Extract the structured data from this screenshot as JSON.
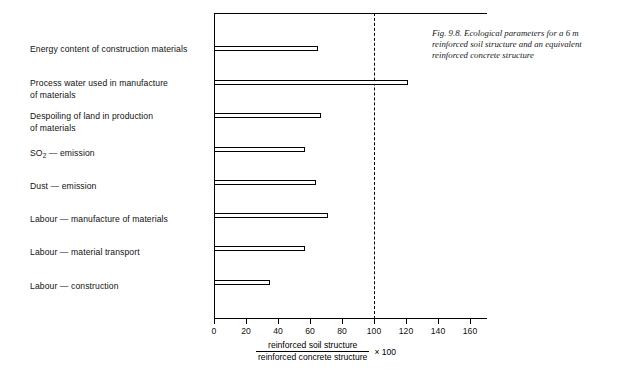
{
  "figure": {
    "caption": "Fig. 9.8. Ecological parameters for a 6 m reinforced soil structure and an equivalent reinforced concrete structure"
  },
  "axis": {
    "tick_labels": [
      "0",
      "20",
      "40",
      "60",
      "80",
      "100",
      "120",
      "140",
      "160"
    ],
    "caption_numerator": "reinforced soil structure",
    "caption_denominator": "reinforced concrete structure",
    "caption_multiplier": "× 100"
  },
  "reference": {
    "value_label": "100"
  },
  "chart_data": {
    "type": "bar",
    "orientation": "horizontal",
    "title": "Fig. 9.8. Ecological parameters for a 6 m reinforced soil structure and an equivalent reinforced concrete structure",
    "xlabel": "reinforced soil structure / reinforced concrete structure × 100",
    "ylabel": "",
    "xlim": [
      0,
      170
    ],
    "xticks": [
      0,
      20,
      40,
      60,
      80,
      100,
      120,
      140,
      160
    ],
    "grid": false,
    "legend": "none",
    "reference_line": 100,
    "categories": [
      "Energy content of construction materials",
      "Process water used in manufacture of materials",
      "Despoiling of land in production of materials",
      "SO2 — emission",
      "Dust — emission",
      "Labour — manufacture of materials",
      "Labour — material transport",
      "Labour — construction"
    ],
    "values": [
      65,
      121,
      67,
      57,
      64,
      71,
      57,
      35
    ]
  },
  "categories": [
    {
      "label": "Energy content of construction materials",
      "value": 65
    },
    {
      "label": "Process water used in manufacture\nof materials",
      "value": 121
    },
    {
      "label": "Despoiling of land in production\nof materials",
      "value": 67
    },
    {
      "label": "SO2 — emission",
      "value": 57,
      "subscript": true
    },
    {
      "label": "Dust — emission",
      "value": 64
    },
    {
      "label": "Labour — manufacture of materials",
      "value": 71
    },
    {
      "label": "Labour — material transport",
      "value": 57
    },
    {
      "label": "Labour — construction",
      "value": 35
    }
  ],
  "colors": {
    "ink": "#000000",
    "background": "#ffffff",
    "bar_fill": "#ffffff",
    "bar_stroke": "#000000"
  }
}
